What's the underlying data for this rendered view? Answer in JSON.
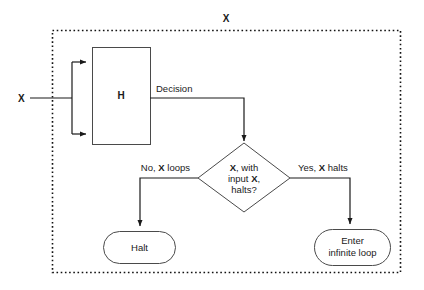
{
  "diagram": {
    "title_label": "X",
    "input_label": "X",
    "machine_label": "H",
    "decision_label": "Decision",
    "decision_node": {
      "line1_bold": "X",
      "line1_rest": ", with",
      "line2_pre": "input ",
      "line2_bold": "X",
      "line2_post": ",",
      "line3": "halts?"
    },
    "branch_no": {
      "pre": "No, ",
      "bold": "X",
      "post": " loops"
    },
    "branch_yes": {
      "pre": "Yes, ",
      "bold": "X",
      "post": " halts"
    },
    "terminal_halt": "Halt",
    "terminal_loop_line1": "Enter",
    "terminal_loop_line2": "infinite loop",
    "colors": {
      "background": "#ffffff",
      "stroke": "#1a1a1a",
      "shape_stroke": "#4a4a4a",
      "border": "#111111"
    }
  }
}
